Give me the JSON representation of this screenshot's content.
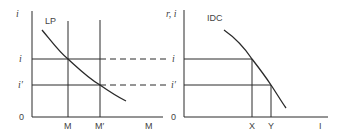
{
  "left_panel": {
    "y_axis_label": "i",
    "origin_label": "0",
    "x_axis_label": "M",
    "curve_label": "LP",
    "x_ticks": [
      {
        "label": "M",
        "x": 68
      },
      {
        "label": "M′",
        "x": 100
      }
    ],
    "y_levels": [
      {
        "label": "i",
        "y": 59
      },
      {
        "label": "i′",
        "y": 85
      }
    ]
  },
  "right_panel": {
    "y_axis_label": "r, i",
    "origin_label": "0",
    "x_axis_label": "I",
    "curve_label": "IDC",
    "x_ticks": [
      {
        "label": "X",
        "x": 252
      },
      {
        "label": "Y",
        "x": 271
      }
    ],
    "y_levels": [
      {
        "label": "i",
        "y": 59
      },
      {
        "label": "i′",
        "y": 85
      }
    ]
  },
  "colors": {
    "line": "#2a2a2a",
    "text": "#444444",
    "background": "#ffffff"
  }
}
